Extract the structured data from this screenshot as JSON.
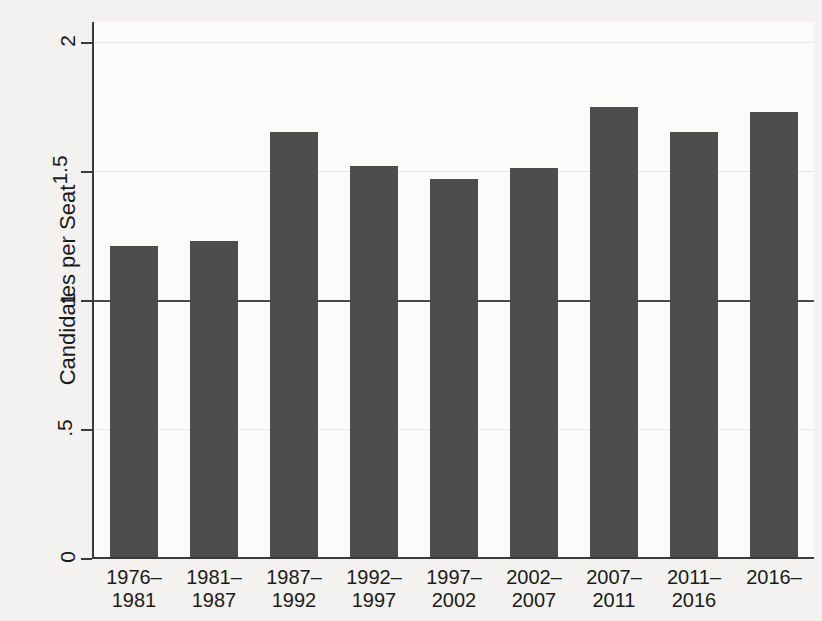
{
  "chart_data": {
    "type": "bar",
    "title": "",
    "subtitle": "",
    "xlabel": "",
    "ylabel": "Candidates per Seat",
    "categories": [
      "1976–\n1981",
      "1981–\n1987",
      "1987–\n1992",
      "1992–\n1997",
      "1997–\n2002",
      "2002–\n2007",
      "2007–\n2011",
      "2011–\n2016",
      "2016–"
    ],
    "values": [
      1.21,
      1.23,
      1.65,
      1.52,
      1.47,
      1.51,
      1.75,
      1.65,
      1.73
    ],
    "ylim": [
      0,
      2
    ],
    "yticks": [
      0,
      0.5,
      1,
      1.5,
      2
    ],
    "ytick_labels": [
      "0",
      ".5",
      "1",
      "1.5",
      "2"
    ],
    "grid": true,
    "legend": false,
    "legend_position": "none",
    "annotations": [
      {
        "name": "reference-line",
        "type": "hline",
        "value": 1,
        "label": ""
      }
    ],
    "bar_color": "#4d4d4d",
    "axis_color": "#3a3a3a",
    "grid_color": "#e6e5e2",
    "reference_line_color": "#4a4a4a",
    "plot_background": "#fbfbfa",
    "figure_background": "#f3f2f0"
  }
}
